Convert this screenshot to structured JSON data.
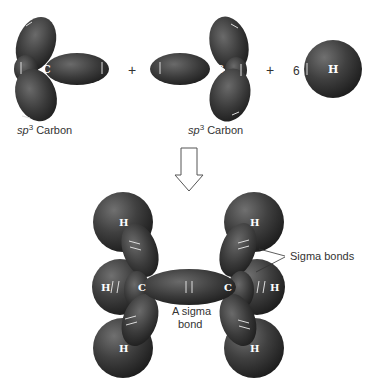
{
  "diagram": {
    "top_row": {
      "left_carbon": {
        "atom": "C",
        "caption_prefix": "sp",
        "caption_sup": "3",
        "caption_suffix": " Carbon"
      },
      "plus_1": "+",
      "right_carbon": {
        "atom": "C",
        "caption_prefix": "sp",
        "caption_sup": "3",
        "caption_suffix": " Carbon"
      },
      "plus_2": "+",
      "hydrogen": {
        "coefficient": "6",
        "atom": "H"
      }
    },
    "arrow": "down-arrow",
    "product": {
      "carbons": [
        "C",
        "C"
      ],
      "hydrogens": [
        "H",
        "H",
        "H",
        "H",
        "H",
        "H"
      ],
      "cc_bond_label_line1": "A sigma",
      "cc_bond_label_line2": "bond",
      "ch_bond_label": "Sigma bonds"
    },
    "colors": {
      "lobe": "#3a3a3a",
      "lobe_highlight": "#6a6a6a",
      "sphere": "#404040",
      "text": "#333333"
    }
  }
}
